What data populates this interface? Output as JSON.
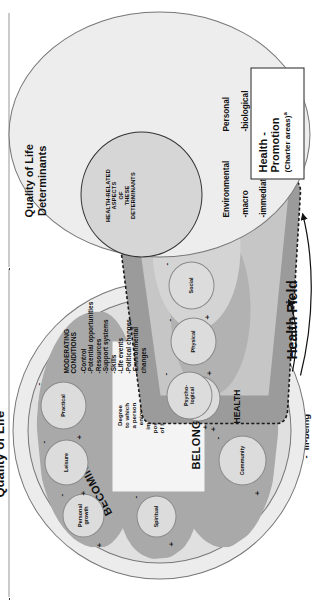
{
  "figure": {
    "title_quality_of_life": "Quality of Life",
    "title_determinants": "Quality of Life\nDeterminants",
    "health_field_label": "Health Field",
    "center_text": "Degree\nto which\na person\nenjoys\nimportant\npossibilities\nof his or her\nlife"
  },
  "legend": {
    "positive_symbol": "+",
    "positive_label": "Well-being",
    "negative_symbol": "-",
    "negative_label": "Ill-being"
  },
  "domains": {
    "being": {
      "name": "BEING",
      "bubbles": [
        {
          "label": "Spiritual",
          "plus": "+",
          "minus": "-"
        }
      ]
    },
    "becoming": {
      "name": "BECOMING",
      "bubbles": [
        {
          "label": "Personal\ngrowth",
          "plus": "+",
          "minus": "-"
        },
        {
          "label": "Leisure",
          "plus": "+",
          "minus": "-"
        },
        {
          "label": "Practical",
          "plus": "+",
          "minus": "-"
        }
      ]
    },
    "belonging": {
      "name": "BELONGING",
      "bubbles": [
        {
          "label": "Eco-\nlogical",
          "plus": "+",
          "minus": "-"
        },
        {
          "label": "Community",
          "plus": "+",
          "minus": "-"
        }
      ]
    },
    "health": {
      "name": "HEALTH",
      "bubbles": [
        {
          "label": "Psycho-\nlogical",
          "plus": "+",
          "minus": "-"
        },
        {
          "label": "Physical",
          "plus": "+",
          "minus": "-"
        },
        {
          "label": "Social",
          "plus": "+",
          "minus": "-"
        }
      ]
    }
  },
  "moderating": {
    "heading": "MODERATING\nCONDITIONS",
    "items": [
      "-Control",
      "-Potential opportunities",
      "-Resources",
      "-Support systems",
      "-Skills",
      "-Life events",
      "-Political changes",
      "-Environmental\n     changes"
    ]
  },
  "determinants": {
    "title": "Quality of Life\nDeterminants",
    "inner_circle_text": "HEALTH-RELATED\nASPECTS\nOF\nTHESE\nDETERMINANTS",
    "groups": [
      {
        "heading": "Environmental",
        "items": [
          "-macro",
          "-immediate"
        ]
      },
      {
        "heading": "Personal",
        "items": [
          "-biological",
          "-psychological"
        ]
      }
    ]
  },
  "callout": {
    "line1": "Health -",
    "line2": "Promotion",
    "line3": "(Charter areas)",
    "superscript": "a"
  },
  "colors": {
    "outer_circle_fill": "#ececec",
    "lobe_fill": "#a9a9a9",
    "bubble_fill": "#dcdcdc",
    "band_fill": "#9e9e9e",
    "band_inner_fill": "#c9c9c9",
    "stroke": "#333333"
  }
}
